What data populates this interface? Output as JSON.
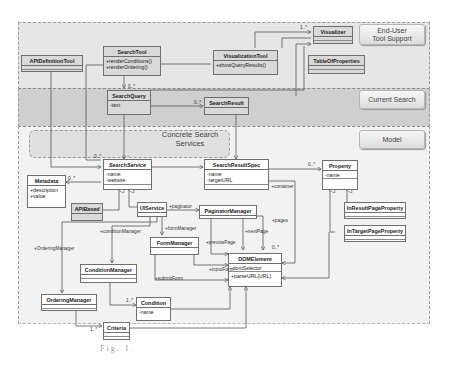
{
  "diagram": {
    "type": "UML class diagram",
    "layers": [
      {
        "id": "end-user",
        "label": "End-User\nTool Support",
        "color": "#e3e3e3"
      },
      {
        "id": "current-search",
        "label": "Current Search",
        "color": "#c9c9c9"
      },
      {
        "id": "model",
        "label": "Model",
        "color": "#f0f0f0"
      }
    ],
    "package_label": "Concrete Search\nServices",
    "classes": {
      "APIDefinitionTool": {
        "name": "APIDefinitionTool",
        "attributes": [],
        "operations": []
      },
      "SearchTool": {
        "name": "SearchTool",
        "attributes": [],
        "operations": [
          "+renderConditions()",
          "+renderOrdering()"
        ]
      },
      "VisualizationTool": {
        "name": "VisualizationTool",
        "attributes": [],
        "operations": [
          "+showQueryResults()"
        ]
      },
      "Visualizer": {
        "name": "Visualizer",
        "attributes": [],
        "operations": []
      },
      "TableOfProperties": {
        "name": "TableOfProperties",
        "attributes": [],
        "operations": []
      },
      "SearchQuery": {
        "name": "SearchQuery",
        "attributes": [
          "-text"
        ],
        "operations": []
      },
      "SearchResult": {
        "name": "SearchResult",
        "attributes": [],
        "operations": []
      },
      "SearchService": {
        "name": "SearchService",
        "attributes": [
          "-name",
          "-website"
        ],
        "operations": []
      },
      "SearchResultSpec": {
        "name": "SearchResultSpec",
        "attributes": [
          "-name",
          "-targetURL"
        ],
        "operations": []
      },
      "Property": {
        "name": "Property",
        "attributes": [
          "-name"
        ],
        "operations": []
      },
      "Metadata": {
        "name": "Metadata",
        "attributes": [
          "+description",
          "+value"
        ],
        "operations": []
      },
      "APIBased": {
        "name": "APIBased",
        "attributes": [],
        "operations": []
      },
      "UIService": {
        "name": "UIService",
        "attributes": [],
        "operations": []
      },
      "PaginatorManager": {
        "name": "PaginatorManager",
        "attributes": [],
        "operations": []
      },
      "InResultPageProperty": {
        "name": "InResultPageProperty",
        "attributes": [],
        "operations": []
      },
      "InTargetPageProperty": {
        "name": "InTargetPageProperty",
        "attributes": [],
        "operations": []
      },
      "FormManager": {
        "name": "FormManager",
        "attributes": [],
        "operations": []
      },
      "ConditionManager": {
        "name": "ConditionManager",
        "attributes": [],
        "operations": []
      },
      "DOMElement": {
        "name": "DOMElement",
        "attributes": [
          "-domSelector"
        ],
        "operations": [
          "+parseURL(URL)"
        ]
      },
      "OrderingManager": {
        "name": "OrderingManager",
        "attributes": [],
        "operations": []
      },
      "Condition": {
        "name": "Condition",
        "attributes": [
          "-name"
        ],
        "operations": []
      },
      "Criteria": {
        "name": "Criteria",
        "attributes": [],
        "operations": []
      }
    },
    "association_labels": {
      "visualizer_mult": "1..*",
      "searchquery_mult": "0..*",
      "searchresult_mult": "0..*",
      "searchservice_mult": "0..*",
      "metadata_mult": "0..*",
      "property_mult": "0..*",
      "domelement_mult": "0..*",
      "condition_mult": "1..*",
      "criteria_mult": "1..*",
      "paginator": "+paginator",
      "formManager": "+formManager",
      "conditionManager": "+conditionManager",
      "orderingManager": "+OrderingManager",
      "pages": "+pages",
      "nextPage": "+nextPage",
      "previousPage": "+previosPage",
      "inputForm": "+inputForm",
      "submitForm": "+submitForm",
      "container": "+container"
    }
  },
  "caption": "Fig. 1."
}
